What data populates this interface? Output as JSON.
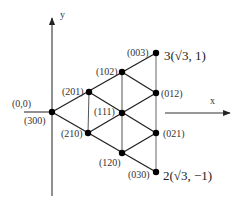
{
  "axes": {
    "x_label": "x",
    "y_label": "y",
    "origin_label": "(0,0)"
  },
  "points": [
    {
      "id": "300",
      "label": "(300)",
      "x": 52,
      "y": 112
    },
    {
      "id": "201",
      "label": "(201)",
      "x": 89,
      "y": 92
    },
    {
      "id": "102",
      "label": "(102)",
      "x": 122,
      "y": 72
    },
    {
      "id": "003",
      "label": "(003)",
      "x": 156,
      "y": 53
    },
    {
      "id": "210",
      "label": "(210)",
      "x": 88,
      "y": 133
    },
    {
      "id": "111",
      "label": "(111)",
      "x": 122,
      "y": 113
    },
    {
      "id": "012",
      "label": "(012)",
      "x": 156,
      "y": 93
    },
    {
      "id": "120",
      "label": "(120)",
      "x": 122,
      "y": 153
    },
    {
      "id": "021",
      "label": "(021)",
      "x": 156,
      "y": 133
    },
    {
      "id": "030",
      "label": "(030)",
      "x": 156,
      "y": 172
    }
  ],
  "vertex_annotations": {
    "top": "3(√3, 1)",
    "bottom": "2(√3, −1)"
  },
  "colors": {
    "line": "#222222",
    "point": "#000000"
  }
}
